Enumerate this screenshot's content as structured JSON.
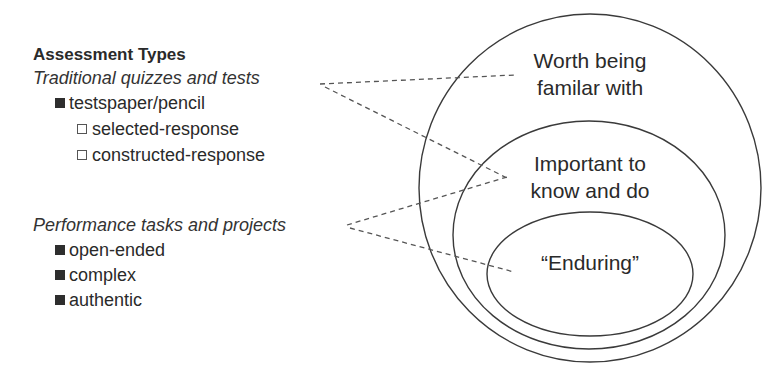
{
  "legend": {
    "heading": "Assessment Types",
    "categories": [
      {
        "label": "Traditional quizzes and tests",
        "items": [
          {
            "label": "testspaper/pencil",
            "bullet": "filled-square",
            "subitems": [
              {
                "label": "selected-response",
                "bullet": "open-square"
              },
              {
                "label": "constructed-response",
                "bullet": "open-square"
              }
            ]
          }
        ]
      },
      {
        "label": "Performance tasks and projects",
        "items": [
          {
            "label": "open-ended",
            "bullet": "filled-square"
          },
          {
            "label": "complex",
            "bullet": "filled-square"
          },
          {
            "label": "authentic",
            "bullet": "filled-square"
          }
        ]
      }
    ]
  },
  "regions": {
    "outer": {
      "line1": "Worth being",
      "line2": "familar with"
    },
    "middle": {
      "line1": "Important to",
      "line2": "know and do"
    },
    "inner": {
      "label": "“Enduring”"
    }
  },
  "connections": [
    {
      "from": "Traditional quizzes and tests",
      "to": "Worth being familar with"
    },
    {
      "from": "Traditional quizzes and tests",
      "to": "Important to know and do"
    },
    {
      "from": "Performance tasks and projects",
      "to": "Important to know and do"
    },
    {
      "from": "Performance tasks and projects",
      "to": "Enduring"
    }
  ],
  "colors": {
    "stroke": "#3a3a3a",
    "text": "#2a2a2a",
    "background": "#ffffff"
  }
}
